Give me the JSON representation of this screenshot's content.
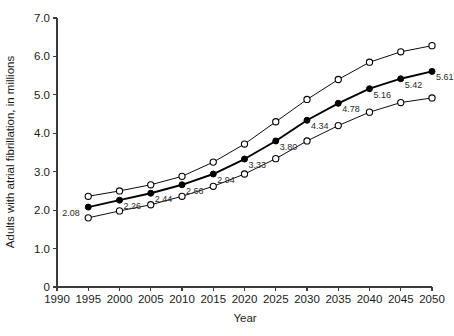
{
  "chart_data": {
    "type": "line",
    "title": "",
    "xlabel": "Year",
    "ylabel": "Adults with atrial fibrillation, in millions",
    "xlim": [
      1990,
      2050
    ],
    "ylim": [
      0,
      7.0
    ],
    "grid": false,
    "legend": "none",
    "x_ticks": [
      1990,
      1995,
      2000,
      2005,
      2010,
      2015,
      2020,
      2025,
      2030,
      2035,
      2040,
      2045,
      2050
    ],
    "x_tick_labels": [
      "1990",
      "1995",
      "2000",
      "2005",
      "2010",
      "2015",
      "2020",
      "2025",
      "2030",
      "2035",
      "2040",
      "2045",
      "2050"
    ],
    "y_ticks": [
      0,
      1.0,
      2.0,
      3.0,
      4.0,
      5.0,
      6.0,
      7.0
    ],
    "y_tick_labels": [
      "0",
      "1.0",
      "2.0",
      "3.0",
      "4.0",
      "5.0",
      "6.0",
      "7.0"
    ],
    "x": [
      1995,
      2000,
      2005,
      2010,
      2015,
      2020,
      2025,
      2030,
      2035,
      2040,
      2045,
      2050
    ],
    "series": [
      {
        "name": "upper-bound",
        "marker": "open-circle",
        "line_weight": "thin",
        "values": [
          2.36,
          2.5,
          2.66,
          2.88,
          3.25,
          3.72,
          4.3,
          4.88,
          5.4,
          5.85,
          6.12,
          6.28
        ]
      },
      {
        "name": "projection",
        "marker": "filled-circle",
        "line_weight": "bold",
        "values": [
          2.08,
          2.26,
          2.44,
          2.66,
          2.94,
          3.33,
          3.8,
          4.34,
          4.78,
          5.16,
          5.42,
          5.61
        ],
        "point_labels": [
          "2.08",
          "2.26",
          "2.44",
          "2.66",
          "2.94",
          "3.33",
          "3.80",
          "4.34",
          "4.78",
          "5.16",
          "5.42",
          "5.61"
        ]
      },
      {
        "name": "lower-bound",
        "marker": "open-circle",
        "line_weight": "thin",
        "values": [
          1.8,
          1.98,
          2.14,
          2.36,
          2.62,
          2.94,
          3.34,
          3.8,
          4.2,
          4.55,
          4.8,
          4.92
        ]
      }
    ]
  }
}
